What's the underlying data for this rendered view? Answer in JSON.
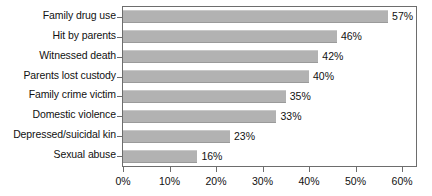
{
  "chart_data": {
    "type": "bar",
    "orientation": "horizontal",
    "title": "",
    "xlabel": "",
    "ylabel": "",
    "categories": [
      "Family drug use",
      "Hit by parents",
      "Witnessed death",
      "Parents lost custody",
      "Family crime victim",
      "Domestic violence",
      "Depressed/suicidal kin",
      "Sexual abuse"
    ],
    "values": [
      57,
      46,
      42,
      40,
      35,
      33,
      23,
      16
    ],
    "value_labels": [
      "57%",
      "46%",
      "42%",
      "40%",
      "35%",
      "33%",
      "23%",
      "16%"
    ],
    "xlim": [
      0,
      63
    ],
    "xticks": [
      0,
      10,
      20,
      30,
      40,
      50,
      60
    ],
    "xtick_labels": [
      "0%",
      "10%",
      "20%",
      "30%",
      "40%",
      "50%",
      "60%"
    ],
    "grid": false,
    "legend": false,
    "bar_color": "#b2b2b2",
    "axis_color": "#6d6d6d",
    "text_color": "#111111",
    "background": "#ffffff"
  }
}
